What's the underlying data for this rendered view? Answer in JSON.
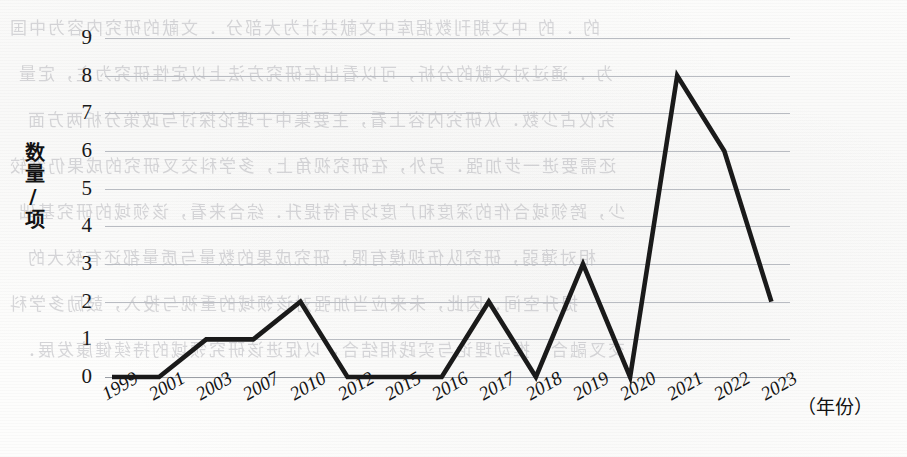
{
  "chart_data": {
    "type": "line",
    "title": "",
    "subtitle": "",
    "xlabel": "（年份）",
    "ylabel": "数量/项",
    "categories": [
      "1999",
      "2001",
      "2003",
      "2007",
      "2010",
      "2012",
      "2015",
      "2016",
      "2017",
      "2018",
      "2019",
      "2020",
      "2021",
      "2022",
      "2023"
    ],
    "values": [
      0,
      0,
      1,
      1,
      2,
      0,
      0,
      0,
      2,
      0,
      3,
      0,
      8,
      6,
      2
    ],
    "series": [
      {
        "name": "数量/项",
        "values": [
          0,
          0,
          1,
          1,
          2,
          0,
          0,
          0,
          2,
          0,
          3,
          0,
          8,
          6,
          2
        ]
      }
    ],
    "ylim": [
      0,
      9
    ],
    "yticks": [
      "0",
      "1",
      "2",
      "3",
      "4",
      "5",
      "6",
      "7",
      "8",
      "9"
    ],
    "grid": "horizontal",
    "legend": "none",
    "line_color": "#1a1a1a",
    "grid_color": "#b9bcc2",
    "annotations": []
  },
  "background": {
    "paper_color": "#fdfdfc",
    "bleed_text_color": "#6e6e76",
    "bleed_lines": [
      "的 ．的 中文期刊数据库中文献共计为大部分 ．文献的研究内容为中国",
      "为 ．通过对文献的分析，可以看出在研究方法上以定性研究为主，定量",
      "究仅占少数．从研究内容上看，主要集中于理论探讨与政策分析两方面",
      "还需要进一步加强．另外，在研究视角上，多学科交叉研究的成果仍然较",
      "少，跨领域合作的深度和广度均有待提升．综合来看，该领域的研究基础",
      "相对薄弱，研究队伍规模有限，研究成果的数量与质量都还有较大的",
      "提升空间．因此，未来应当加强对该领域的重视与投入，鼓励多学科",
      "交叉融合，推动理论与实践相结合，以促进该研究领域的持续健康发展．"
    ]
  }
}
